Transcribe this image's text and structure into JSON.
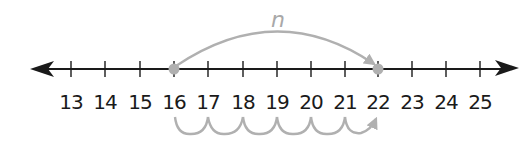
{
  "diagram": {
    "type": "number-line",
    "axis": {
      "min": 13,
      "max": 25,
      "step": 1,
      "tick_labels": [
        "13",
        "14",
        "15",
        "16",
        "17",
        "18",
        "19",
        "20",
        "21",
        "22",
        "23",
        "24",
        "25"
      ],
      "arrows": [
        "left",
        "right"
      ],
      "line_color": "#1a1a1a"
    },
    "points": [
      {
        "value": 16,
        "color": "#b0b0b0"
      },
      {
        "value": 22,
        "color": "#b0b0b0"
      }
    ],
    "big_jump": {
      "from": 16,
      "to": 22,
      "label": "n",
      "color": "#b0b0b0"
    },
    "unit_hops": {
      "from": 16,
      "to": 22,
      "count": 6,
      "color": "#b0b0b0"
    }
  }
}
